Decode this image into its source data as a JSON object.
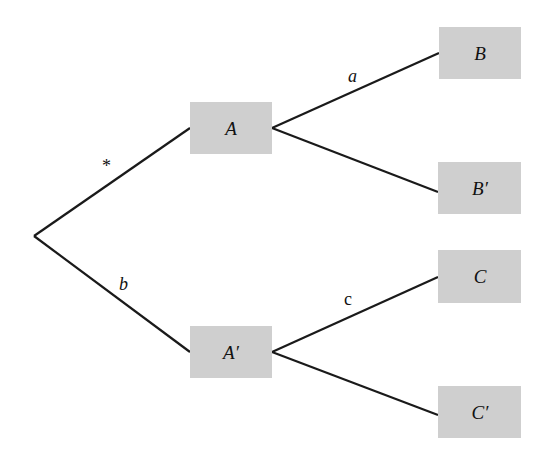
{
  "diagram": {
    "type": "tree",
    "root": {
      "x": 34,
      "y": 236
    },
    "nodes": [
      {
        "id": "A",
        "label": "A",
        "x": 190,
        "y": 102,
        "w": 82,
        "h": 52
      },
      {
        "id": "A_prime",
        "label": "A′",
        "x": 190,
        "y": 326,
        "w": 82,
        "h": 52
      },
      {
        "id": "B",
        "label": "B",
        "x": 439,
        "y": 27,
        "w": 82,
        "h": 52
      },
      {
        "id": "B_prime",
        "label": "B′",
        "x": 438,
        "y": 162,
        "w": 83,
        "h": 52
      },
      {
        "id": "C",
        "label": "C",
        "x": 438,
        "y": 250,
        "w": 83,
        "h": 53
      },
      {
        "id": "C_prime",
        "label": "C′",
        "x": 438,
        "y": 386,
        "w": 83,
        "h": 52
      }
    ],
    "edges": [
      {
        "from": "root",
        "to": "A",
        "label": "*",
        "label_x": 106,
        "label_y": 170,
        "italic": false
      },
      {
        "from": "root",
        "to": "A_prime",
        "label": "b",
        "label_x": 122,
        "label_y": 289,
        "italic": true
      },
      {
        "from": "A",
        "to": "B",
        "label": "a",
        "label_x": 351,
        "label_y": 80,
        "italic": true
      },
      {
        "from": "A",
        "to": "B_prime",
        "label": "",
        "label_x": 0,
        "label_y": 0,
        "italic": false
      },
      {
        "from": "A_prime",
        "to": "C",
        "label": "c",
        "label_x": 346,
        "label_y": 303,
        "italic": false
      },
      {
        "from": "A_prime",
        "to": "C_prime",
        "label": "",
        "label_x": 0,
        "label_y": 0,
        "italic": false
      }
    ]
  },
  "labels": {
    "A": "A",
    "A_prime": "A′",
    "B": "B",
    "B_prime": "B′",
    "C": "C",
    "C_prime": "C′",
    "edge_star": "*",
    "edge_a": "a",
    "edge_b": "b",
    "edge_c": "c"
  },
  "colors": {
    "node_fill": "#cfcfcf",
    "edge_stroke": "#1a1a1a",
    "background": "#ffffff"
  }
}
